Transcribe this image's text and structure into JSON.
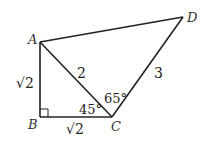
{
  "diagram": {
    "type": "geometry",
    "points": {
      "A": {
        "label": "A",
        "x": 40,
        "y": 42
      },
      "B": {
        "label": "B",
        "x": 40,
        "y": 117
      },
      "C": {
        "label": "C",
        "x": 112,
        "y": 117
      },
      "D": {
        "label": "D",
        "x": 183,
        "y": 17
      }
    },
    "segments": [
      {
        "from": "A",
        "to": "B",
        "label": "√2"
      },
      {
        "from": "B",
        "to": "C",
        "label": "√2"
      },
      {
        "from": "A",
        "to": "C",
        "label": "2"
      },
      {
        "from": "C",
        "to": "D",
        "label": "3"
      },
      {
        "from": "A",
        "to": "D",
        "label": ""
      }
    ],
    "angles": {
      "ACB": "45°",
      "ACD": "65°"
    },
    "right_angle_at": "B",
    "colors": {
      "stroke": "#222222",
      "background": "#ffffff"
    }
  }
}
